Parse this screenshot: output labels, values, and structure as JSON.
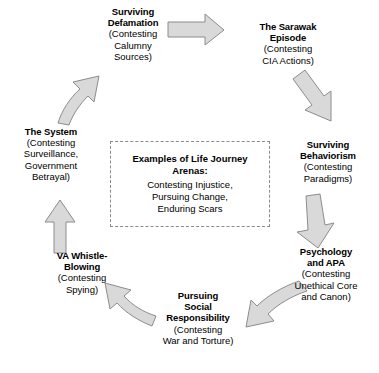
{
  "diagram": {
    "type": "cycle",
    "node_count": 7,
    "arrow_count": 7,
    "colors": {
      "arrow_fill": "#d9d9d9",
      "arrow_stroke": "#8c8c8c",
      "text": "#000000",
      "box_border": "#8a8a8a",
      "background": "#ffffff"
    },
    "nodes": [
      {
        "id": "surviving-defamation",
        "title": "Surviving\nDefamation",
        "sub": "(Contesting\nCalumny\nSources)"
      },
      {
        "id": "the-sarawak-episode",
        "title": "The Sarawak\nEpisode",
        "sub": "(Contesting\nCIA Actions)"
      },
      {
        "id": "surviving-behaviorism",
        "title": "Surviving\nBehaviorism",
        "sub": "(Contesting\nParadigms)"
      },
      {
        "id": "psychology-and-apa",
        "title": "Psychology\nand APA",
        "sub": "(Contesting\nUnethical Core\nand Canon)"
      },
      {
        "id": "pursuing-social-responsibility",
        "title": "Pursuing\nSocial\nResponsibility",
        "sub": "(Contesting\nWar and Torture)"
      },
      {
        "id": "va-whistle-blowing",
        "title": "VA Whistle-\nBlowing",
        "sub": "(Contesting\nSpying)"
      },
      {
        "id": "the-system",
        "title": "The System",
        "sub": "(Contesting\nSurveillance,\nGovernment\nBetrayal)"
      }
    ],
    "center_box": {
      "title": "Examples of Life Journey\nArenas:",
      "body": "Contesting Injustice,\nPursuing Change,\nEnduring Scars"
    },
    "arrows": [
      {
        "id": "arrow-defamation-to-sarawak",
        "direction": "right"
      },
      {
        "id": "arrow-sarawak-to-behaviorism",
        "direction": "down-right"
      },
      {
        "id": "arrow-behaviorism-to-psychology",
        "direction": "down"
      },
      {
        "id": "arrow-psychology-to-social-responsibility",
        "direction": "down-left"
      },
      {
        "id": "arrow-social-responsibility-to-va",
        "direction": "up-left"
      },
      {
        "id": "arrow-va-to-system",
        "direction": "up"
      },
      {
        "id": "arrow-system-to-defamation",
        "direction": "up-right"
      }
    ]
  }
}
